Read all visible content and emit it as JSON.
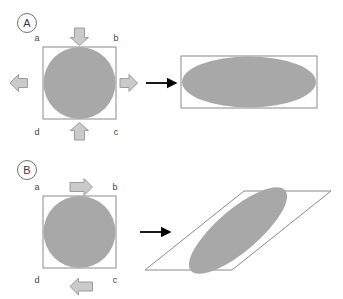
{
  "figure": {
    "background": "#ffffff",
    "shape_fill": "#a8a8a8",
    "outline_color": "#777777",
    "gray_arrow_fill": "#c9c9c9",
    "gray_arrow_stroke": "#9a9a9a",
    "black_arrow_color": "#000000",
    "label_color": "#444444"
  },
  "panels": [
    {
      "id": "A",
      "letter": "A",
      "deformation": "normal-compression-extension",
      "corner_labels": {
        "top_left": "a",
        "top_right": "b",
        "bottom_right": "c",
        "bottom_left": "d"
      },
      "load_arrows": [
        {
          "name": "top-load-arrow",
          "direction": "down"
        },
        {
          "name": "bottom-load-arrow",
          "direction": "up"
        },
        {
          "name": "left-load-arrow",
          "direction": "left"
        },
        {
          "name": "right-load-arrow",
          "direction": "right"
        }
      ],
      "transform_arrow": {
        "name": "transform-arrow",
        "direction": "right"
      },
      "before": {
        "outline": "square",
        "inner": "circle"
      },
      "after": {
        "outline": "rectangle",
        "inner": "ellipse"
      }
    },
    {
      "id": "B",
      "letter": "B",
      "deformation": "simple-shear",
      "corner_labels": {
        "top_left": "a",
        "top_right": "b",
        "bottom_right": "c",
        "bottom_left": "d"
      },
      "load_arrows": [
        {
          "name": "top-shear-arrow",
          "direction": "right"
        },
        {
          "name": "bottom-shear-arrow",
          "direction": "left"
        }
      ],
      "transform_arrow": {
        "name": "transform-arrow",
        "direction": "right"
      },
      "before": {
        "outline": "square",
        "inner": "circle"
      },
      "after": {
        "outline": "parallelogram",
        "inner": "tilted-ellipse"
      }
    }
  ]
}
